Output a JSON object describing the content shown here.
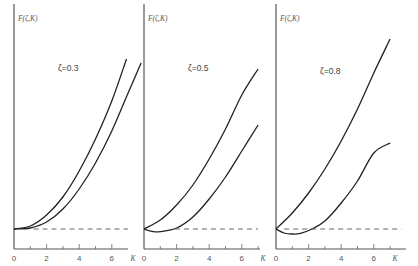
{
  "chart_data": [
    {
      "type": "line",
      "title": "ζ=0.3",
      "ylabel": "F(ζ,K)",
      "xlabel": "K",
      "x_ticks": [
        0,
        2,
        4,
        6
      ],
      "xlim": [
        0,
        7
      ],
      "grid": false,
      "series": [
        {
          "name": "upper",
          "x": [
            0,
            1,
            2,
            3,
            4,
            5,
            6,
            6.9
          ],
          "y": [
            1.0,
            1.15,
            1.7,
            2.6,
            3.9,
            5.5,
            7.4,
            9.5
          ]
        },
        {
          "name": "lower",
          "x": [
            0,
            1,
            2,
            3,
            4,
            5,
            6,
            7.0,
            7.8
          ],
          "y": [
            1.0,
            1.05,
            1.35,
            2.0,
            3.0,
            4.3,
            5.9,
            7.8,
            9.3
          ]
        },
        {
          "name": "reference (dashed)",
          "x": [
            1.2,
            7.0
          ],
          "y": [
            1.0,
            1.0
          ],
          "style": "dashed"
        }
      ]
    },
    {
      "type": "line",
      "title": "ζ=0.5",
      "ylabel": "F(ζ,K)",
      "xlabel": "K",
      "x_ticks": [
        0,
        2,
        4,
        6
      ],
      "xlim": [
        0,
        7
      ],
      "grid": false,
      "series": [
        {
          "name": "upper",
          "x": [
            0,
            1,
            2,
            3,
            4,
            5,
            6,
            7.0
          ],
          "y": [
            1.0,
            1.45,
            2.2,
            3.2,
            4.5,
            6.0,
            7.7,
            9.0
          ]
        },
        {
          "name": "lower",
          "x": [
            0,
            0.5,
            1,
            2,
            3,
            4,
            5,
            6,
            7.0
          ],
          "y": [
            1.0,
            0.88,
            0.87,
            1.05,
            1.6,
            2.5,
            3.6,
            4.9,
            6.2
          ]
        },
        {
          "name": "reference (dashed)",
          "x": [
            1.9,
            7.0
          ],
          "y": [
            1.0,
            1.0
          ],
          "style": "dashed"
        }
      ]
    },
    {
      "type": "line",
      "title": "ζ=0.8",
      "ylabel": "F(ζ,K)",
      "xlabel": "K",
      "x_ticks": [
        0,
        2,
        4,
        6
      ],
      "xlim": [
        0,
        7.5
      ],
      "grid": false,
      "series": [
        {
          "name": "upper",
          "x": [
            0,
            1,
            2,
            3,
            4,
            5,
            6,
            7.0
          ],
          "y": [
            1.0,
            1.8,
            2.8,
            4.0,
            5.4,
            7.0,
            8.8,
            10.5
          ]
        },
        {
          "name": "lower",
          "x": [
            0,
            0.5,
            1,
            1.5,
            2.2,
            3,
            4,
            5,
            6,
            7.0
          ],
          "y": [
            1.0,
            0.8,
            0.75,
            0.78,
            1.0,
            1.4,
            2.3,
            3.4,
            4.8,
            5.3
          ]
        },
        {
          "name": "reference (dashed)",
          "x": [
            0.5,
            7.7
          ],
          "y": [
            1.0,
            1.0
          ],
          "style": "dashed"
        }
      ]
    }
  ],
  "panels": [
    {
      "zeta_label": "ζ=0.3",
      "y_label": "F(ζ,K)",
      "x_label": "K",
      "ticks": [
        "0",
        "2",
        "4",
        "6"
      ]
    },
    {
      "zeta_label": "ζ=0.5",
      "y_label": "F(ζ,K)",
      "x_label": "K",
      "ticks": [
        "0",
        "2",
        "4",
        "6"
      ]
    },
    {
      "zeta_label": "ζ=0.8",
      "y_label": "F(ζ,K)",
      "x_label": "K",
      "ticks": [
        "0",
        "2",
        "4",
        "6"
      ]
    }
  ]
}
